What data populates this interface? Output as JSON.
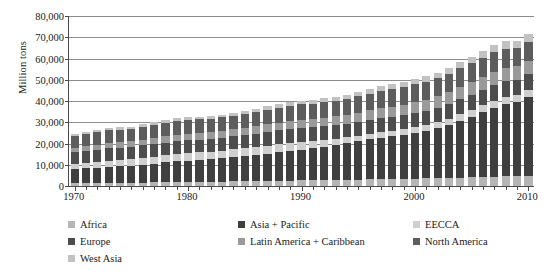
{
  "chart_data": {
    "type": "bar",
    "stacked": true,
    "title": "",
    "xlabel": "",
    "ylabel": "Million tons",
    "ylim": [
      0,
      80000
    ],
    "ytick_values": [
      0,
      10000,
      20000,
      30000,
      40000,
      50000,
      60000,
      70000,
      80000
    ],
    "ytick_labels": [
      "0",
      "10,000",
      "20,000",
      "30,000",
      "40,000",
      "50,000",
      "60,000",
      "70,000",
      "80,000"
    ],
    "grid": true,
    "legend_position": "below",
    "x": [
      1970,
      1971,
      1972,
      1973,
      1974,
      1975,
      1976,
      1977,
      1978,
      1979,
      1980,
      1981,
      1982,
      1983,
      1984,
      1985,
      1986,
      1987,
      1988,
      1989,
      1990,
      1991,
      1992,
      1993,
      1994,
      1995,
      1996,
      1997,
      1998,
      1999,
      2000,
      2001,
      2002,
      2003,
      2004,
      2005,
      2006,
      2007,
      2008,
      2009,
      2010
    ],
    "xtick_labels": [
      "1970",
      "1980",
      "1990",
      "2000",
      "2010"
    ],
    "xtick_values": [
      1970,
      1980,
      1990,
      2000,
      2010
    ],
    "series": [
      {
        "name": "Africa",
        "color": "#b5b5b5",
        "values": [
          1300,
          1350,
          1400,
          1460,
          1520,
          1580,
          1650,
          1720,
          1800,
          1870,
          1950,
          2000,
          2060,
          2120,
          2190,
          2260,
          2340,
          2410,
          2490,
          2570,
          2650,
          2720,
          2790,
          2860,
          2940,
          3020,
          3110,
          3200,
          3290,
          3380,
          3480,
          3580,
          3690,
          3800,
          3930,
          4060,
          4200,
          4350,
          4500,
          4620,
          4760
        ]
      },
      {
        "name": "Asia + Pacific",
        "color": "#3f3f3f",
        "values": [
          6600,
          6900,
          7250,
          7600,
          7800,
          8050,
          8450,
          8850,
          9300,
          9700,
          10000,
          10250,
          10550,
          10900,
          11350,
          11800,
          12300,
          12850,
          13450,
          14000,
          14500,
          15100,
          15800,
          16500,
          17200,
          18000,
          18800,
          19600,
          20100,
          20700,
          21500,
          22300,
          23400,
          25000,
          26800,
          28600,
          30500,
          32500,
          34000,
          35000,
          37000
        ]
      },
      {
        "name": "EECCA",
        "color": "#cfcfcf",
        "values": [
          2600,
          2700,
          2800,
          2900,
          3000,
          3100,
          3200,
          3280,
          3360,
          3430,
          3500,
          3540,
          3580,
          3620,
          3660,
          3700,
          3740,
          3780,
          3800,
          3780,
          3700,
          3500,
          3200,
          2950,
          2750,
          2650,
          2600,
          2580,
          2570,
          2600,
          2680,
          2760,
          2840,
          2930,
          3030,
          3120,
          3230,
          3340,
          3420,
          3330,
          3450
        ]
      },
      {
        "name": "Europe",
        "color": "#4d4d4d",
        "values": [
          5400,
          5500,
          5600,
          5750,
          5700,
          5650,
          5800,
          5850,
          5950,
          6050,
          6050,
          6000,
          5980,
          6020,
          6120,
          6200,
          6300,
          6380,
          6450,
          6480,
          6450,
          6380,
          6350,
          6300,
          6350,
          6420,
          6520,
          6580,
          6650,
          6700,
          6800,
          6880,
          6950,
          7050,
          7180,
          7280,
          7400,
          7480,
          7500,
          7100,
          7300
        ]
      },
      {
        "name": "Latin America + Caribbean",
        "color": "#9a9a9a",
        "values": [
          2200,
          2300,
          2400,
          2520,
          2620,
          2700,
          2800,
          2900,
          3000,
          3100,
          3180,
          3220,
          3260,
          3310,
          3380,
          3450,
          3540,
          3620,
          3710,
          3800,
          3880,
          3970,
          4070,
          4180,
          4300,
          4420,
          4550,
          4690,
          4800,
          4880,
          5020,
          5130,
          5260,
          5400,
          5580,
          5750,
          5930,
          6120,
          6280,
          6250,
          6500
        ]
      },
      {
        "name": "North America",
        "color": "#5d5d5d",
        "values": [
          5600,
          5750,
          5900,
          6050,
          5950,
          5900,
          6100,
          6250,
          6400,
          6500,
          6400,
          6350,
          6250,
          6300,
          6500,
          6600,
          6700,
          6850,
          7050,
          7150,
          7200,
          7150,
          7250,
          7380,
          7550,
          7700,
          7880,
          8050,
          8150,
          8280,
          8450,
          8400,
          8500,
          8620,
          8820,
          8950,
          9050,
          9150,
          9000,
          8500,
          8800
        ]
      },
      {
        "name": "West Asia",
        "color": "#c2c2c2",
        "values": [
          800,
          840,
          880,
          930,
          970,
          1010,
          1060,
          1110,
          1160,
          1210,
          1250,
          1280,
          1320,
          1360,
          1410,
          1460,
          1510,
          1570,
          1630,
          1690,
          1740,
          1790,
          1850,
          1910,
          1980,
          2050,
          2130,
          2210,
          2280,
          2350,
          2440,
          2520,
          2610,
          2710,
          2830,
          2940,
          3070,
          3200,
          3320,
          3380,
          3520
        ]
      }
    ],
    "totals": [
      24500,
      25340,
      26230,
      27210,
      27560,
      27990,
      29060,
      29960,
      30970,
      31860,
      32330,
      32640,
      33000,
      33630,
      34610,
      35470,
      36430,
      37460,
      38580,
      39470,
      40120,
      40610,
      41310,
      42080,
      43070,
      44260,
      45590,
      46910,
      47840,
      48890,
      50370,
      51570,
      53250,
      55510,
      58170,
      60700,
      63380,
      66140,
      68020,
      68180,
      71330
    ]
  },
  "legend": {
    "items": [
      {
        "label": "Africa"
      },
      {
        "label": "Asia + Pacific"
      },
      {
        "label": "EECCA"
      },
      {
        "label": "Europe"
      },
      {
        "label": "Latin America + Caribbean"
      },
      {
        "label": "North America"
      },
      {
        "label": "West Asia"
      }
    ]
  }
}
